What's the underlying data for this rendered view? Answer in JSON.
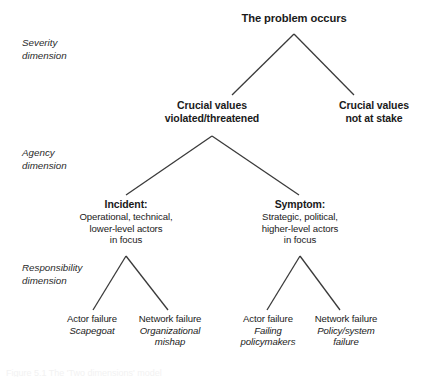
{
  "figure": {
    "title": "The problem occurs",
    "caption": "Figure 5.1  The 'Two dimensions' model",
    "line_color": "#3a3a3a"
  },
  "dimensions": [
    {
      "id": "severity",
      "line1": "Severity",
      "line2": "dimension"
    },
    {
      "id": "agency",
      "line1": "Agency",
      "line2": "dimension"
    },
    {
      "id": "responsibility",
      "line1": "Responsibility",
      "line2": "dimension"
    }
  ],
  "nodes": {
    "root": {
      "head": "The problem occurs"
    },
    "values_violated": {
      "head_line1": "Crucial values",
      "head_line2": "violated/threatened"
    },
    "values_safe": {
      "head_line1": "Crucial values",
      "head_line2": "not at stake"
    },
    "incident": {
      "head": "Incident:",
      "line1": "Operational, technical,",
      "line2": "lower-level actors",
      "line3": "in focus"
    },
    "symptom": {
      "head": "Symptom:",
      "line1": "Strategic, political,",
      "line2": "higher-level actors",
      "line3": "in focus"
    },
    "leaf_actor_scapegoat": {
      "line1": "Actor failure",
      "line2": "Scapegoat"
    },
    "leaf_network_org": {
      "line1": "Network failure",
      "line2": "Organizational",
      "line3": "mishap"
    },
    "leaf_actor_failing": {
      "line1": "Actor failure",
      "line2": "Failing",
      "line3": "policymakers"
    },
    "leaf_network_policy": {
      "line1": "Network failure",
      "line2": "Policy/system",
      "line3": "failure"
    }
  }
}
